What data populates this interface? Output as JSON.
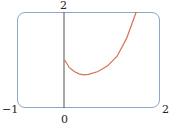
{
  "chart_data": {
    "type": "line",
    "title": "",
    "xlabel": "",
    "ylabel": "",
    "xlim": [
      -1,
      2
    ],
    "ylim": [
      0,
      2
    ],
    "x_ticks": [
      "-1",
      "0",
      "2"
    ],
    "y_ticks": [
      "2"
    ],
    "grid": false,
    "series": [
      {
        "name": "curve",
        "color": "#d9704f",
        "x": [
          0,
          0.1,
          0.2,
          0.3,
          0.4,
          0.5,
          0.7,
          0.9,
          1.1,
          1.3,
          1.5
        ],
        "y": [
          1.0,
          0.84,
          0.76,
          0.71,
          0.69,
          0.7,
          0.76,
          0.88,
          1.08,
          1.45,
          2.0
        ]
      }
    ]
  },
  "labels": {
    "x_min": "−1",
    "x_zero": "0",
    "x_max": "2",
    "y_max": "2"
  },
  "colors": {
    "frame": "#8aa7c8",
    "axis": "#555555",
    "curve": "#d9704f"
  }
}
